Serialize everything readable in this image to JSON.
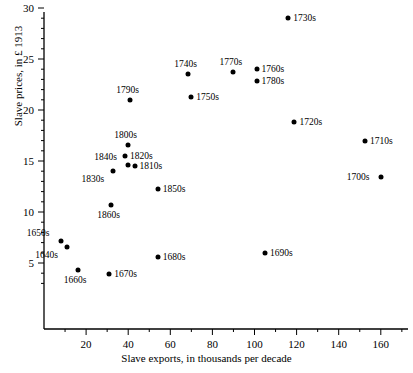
{
  "chart_data": {
    "type": "scatter",
    "title": "",
    "xlabel": "Slave exports, in thousands per decade",
    "ylabel": "Slave prices, in £ 1913",
    "xlim": [
      0,
      172
    ],
    "ylim": [
      2.2,
      30.8
    ],
    "xticks": [
      20,
      40,
      60,
      80,
      100,
      120,
      140,
      160
    ],
    "yticks": [
      5,
      10,
      15,
      20,
      25,
      30
    ],
    "minor_xticks": [
      10,
      30,
      50,
      70,
      90,
      110,
      130,
      150,
      170
    ],
    "minor_yticks": [],
    "grid": false,
    "legend": null,
    "points": [
      {
        "label": "1650s",
        "x": 8,
        "y": 7.2,
        "label_pos": "top-left"
      },
      {
        "label": "1640s",
        "x": 11,
        "y": 6.6,
        "label_pos": "bottom-left"
      },
      {
        "label": "1660s",
        "x": 16,
        "y": 4.3,
        "label_pos": "bottom"
      },
      {
        "label": "1670s",
        "x": 31,
        "y": 3.9,
        "label_pos": "right"
      },
      {
        "label": "1680s",
        "x": 54,
        "y": 5.6,
        "label_pos": "right"
      },
      {
        "label": "1690s",
        "x": 105,
        "y": 6.0,
        "label_pos": "right"
      },
      {
        "label": "1700s",
        "x": 160,
        "y": 13.4,
        "label_pos": "left"
      },
      {
        "label": "1710s",
        "x": 152.5,
        "y": 17.0,
        "label_pos": "right"
      },
      {
        "label": "1720s",
        "x": 119,
        "y": 18.8,
        "label_pos": "right"
      },
      {
        "label": "1730s",
        "x": 116,
        "y": 29.0,
        "label_pos": "right"
      },
      {
        "label": "1740s",
        "x": 68.5,
        "y": 23.5,
        "label_pos": "top"
      },
      {
        "label": "1750s",
        "x": 70,
        "y": 21.3,
        "label_pos": "right"
      },
      {
        "label": "1760s",
        "x": 101,
        "y": 24.0,
        "label_pos": "right"
      },
      {
        "label": "1770s",
        "x": 90,
        "y": 23.7,
        "label_pos": "top"
      },
      {
        "label": "1780s",
        "x": 101,
        "y": 22.8,
        "label_pos": "right"
      },
      {
        "label": "1790s",
        "x": 41,
        "y": 21.0,
        "label_pos": "top"
      },
      {
        "label": "1800s",
        "x": 40,
        "y": 16.6,
        "label_pos": "top"
      },
      {
        "label": "1810s",
        "x": 43,
        "y": 14.5,
        "label_pos": "right"
      },
      {
        "label": "1820s",
        "x": 38.5,
        "y": 15.5,
        "label_pos": "right"
      },
      {
        "label": "1830s",
        "x": 33,
        "y": 14.0,
        "label_pos": "bottom-left"
      },
      {
        "label": "1840s",
        "x": 40,
        "y": 14.6,
        "label_pos": "top-left"
      },
      {
        "label": "1850s",
        "x": 54,
        "y": 12.3,
        "label_pos": "right"
      },
      {
        "label": "1860s",
        "x": 32,
        "y": 10.7,
        "label_pos": "bottom"
      }
    ]
  },
  "axis": {
    "x_tick_labels": [
      "20",
      "40",
      "60",
      "80",
      "100",
      "120",
      "140",
      "160"
    ],
    "y_tick_labels": [
      "5",
      "10",
      "15",
      "20",
      "25",
      "30"
    ]
  },
  "colors": {
    "marker": "#000000",
    "axis": "#000000",
    "background": "#ffffff"
  }
}
